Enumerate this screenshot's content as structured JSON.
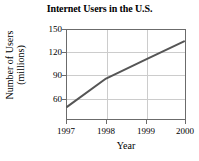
{
  "chart_data": {
    "type": "line",
    "title": "Internet Users in the U.S.",
    "xlabel": "Year",
    "ylabel_line1": "Number of Users",
    "ylabel_line2": "(millions)",
    "ylabel": "Number of Users (millions)",
    "x": [
      1997,
      1998,
      1999,
      2000
    ],
    "values": [
      55,
      90,
      113,
      136
    ],
    "xticklabels": [
      "1997",
      "1998",
      "1999",
      "2000"
    ],
    "yticklabels": [
      "60",
      "90",
      "120",
      "150"
    ],
    "yticks": [
      60,
      90,
      120,
      150
    ],
    "xlim": [
      1997,
      2000
    ],
    "ylim": [
      40,
      150
    ],
    "grid": true,
    "legend": "none",
    "line_color": "#555555",
    "grid_color": "#cccccc",
    "axis_color": "#6b6b6b",
    "background": "#ffffff"
  }
}
